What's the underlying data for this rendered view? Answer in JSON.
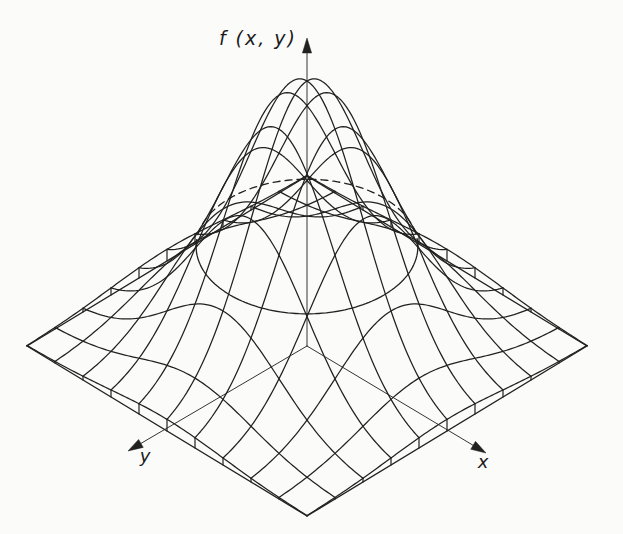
{
  "chart_data": {
    "type": "surface",
    "title": "",
    "subtitle": "",
    "function": "f(x,y) = exp(-(x^2 + y^2) / (2 * sigma^2))",
    "sigma": 0.4,
    "peak_value": 1,
    "z_label": "f (x, y)",
    "x_label": "x",
    "y_label": "y",
    "domain": {
      "min": -1,
      "max": 1,
      "step": 0.2,
      "grid_lines_per_direction": 11
    },
    "projection": {
      "cx": 307,
      "cy": 346,
      "ax": 140,
      "ay": 85,
      "h": 265
    },
    "contour": {
      "radius": 0.56,
      "front_half": "solid",
      "back_half": "dashed"
    },
    "axes": {
      "z": {
        "tip": [
          307,
          38
        ],
        "label": "f (x, y)"
      },
      "x": {
        "tip": [
          486,
          453
        ],
        "label": "x"
      },
      "y": {
        "tip": [
          128,
          451
        ],
        "label": "y"
      },
      "arrow_length": 15,
      "arrow_half_width": 4.6
    },
    "legend": null,
    "gridlines": "mesh only, no axis ticks, no tick labels",
    "style": {
      "line_color": "#212121",
      "axis_color": "#2a2a2a",
      "background": "#fbfbfa",
      "mesh_stroke": 1.25,
      "base_stroke": 1.35,
      "skirt_stroke": 1.2,
      "axis_stroke": 0.95,
      "contour_stroke": 1.3,
      "contour_dash": "7 5"
    }
  }
}
